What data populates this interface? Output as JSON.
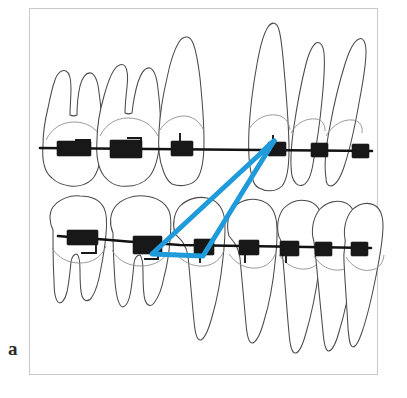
{
  "figure": {
    "panel_label": "a",
    "caption_text": "",
    "frame": {
      "border_color": "#c9c9c9",
      "background": "#ffffff"
    }
  },
  "colors": {
    "elastic_blue": "#1f9bdc",
    "bracket_black": "#181818",
    "archwire_black": "#121212",
    "tooth_outline": "#4a4a4a",
    "crown_line": "#8f8f8f",
    "frame_border": "#c9c9c9",
    "background": "#ffffff"
  },
  "diagram": {
    "type": "orthodontic-appliance-illustration",
    "title": "",
    "arches": [
      {
        "name": "upper-arch",
        "archwire": {
          "x1": 40,
          "y1": 148,
          "x2": 372,
          "y2": 150
        },
        "teeth": [
          {
            "name": "upper-second-molar",
            "type": "molar",
            "roots": 2,
            "cx": 73
          },
          {
            "name": "upper-first-molar",
            "type": "molar",
            "roots": 2,
            "cx": 124
          },
          {
            "name": "upper-second-premolar",
            "type": "premolar",
            "roots": 1,
            "cx": 180
          },
          {
            "name": "upper-canine",
            "type": "canine",
            "roots": 1,
            "cx": 275
          },
          {
            "name": "upper-lateral-incisor",
            "type": "incisor",
            "roots": 1,
            "cx": 311
          },
          {
            "name": "upper-central-incisor",
            "type": "incisor",
            "roots": 1,
            "cx": 345
          }
        ],
        "brackets": [
          {
            "name": "bracket-upper-second-molar",
            "x": 73,
            "y": 148,
            "style": "molar-tube"
          },
          {
            "name": "bracket-upper-first-molar",
            "x": 124,
            "y": 148,
            "style": "molar-tube"
          },
          {
            "name": "bracket-upper-second-premolar",
            "x": 180,
            "y": 147,
            "style": "premolar-bracket"
          },
          {
            "name": "bracket-upper-canine",
            "x": 277,
            "y": 148,
            "style": "anterior-bracket"
          },
          {
            "name": "bracket-upper-lateral-incisor",
            "x": 320,
            "y": 149,
            "style": "anterior-bracket"
          },
          {
            "name": "bracket-upper-central-incisor",
            "x": 361,
            "y": 150,
            "style": "anterior-bracket"
          }
        ]
      },
      {
        "name": "lower-arch",
        "archwire": {
          "x1": 58,
          "y1": 237,
          "x2": 371,
          "y2": 247
        },
        "teeth": [
          {
            "name": "lower-second-molar",
            "type": "molar",
            "roots": 2,
            "cx": 78
          },
          {
            "name": "lower-first-molar",
            "type": "molar",
            "roots": 2,
            "cx": 140
          },
          {
            "name": "lower-second-premolar",
            "type": "premolar",
            "roots": 1,
            "cx": 196
          },
          {
            "name": "lower-first-premolar",
            "type": "premolar",
            "roots": 1,
            "cx": 247
          },
          {
            "name": "lower-canine",
            "type": "canine",
            "roots": 1,
            "cx": 291
          },
          {
            "name": "lower-lateral-incisor",
            "type": "incisor",
            "roots": 1,
            "cx": 326
          },
          {
            "name": "lower-central-incisor",
            "type": "incisor",
            "roots": 1,
            "cx": 358
          }
        ],
        "brackets": [
          {
            "name": "bracket-lower-second-molar",
            "x": 80,
            "y": 237,
            "style": "molar-tube"
          },
          {
            "name": "bracket-lower-first-molar",
            "x": 145,
            "y": 243,
            "style": "molar-tube"
          },
          {
            "name": "bracket-lower-second-premolar",
            "x": 204,
            "y": 246,
            "style": "premolar-bracket"
          },
          {
            "name": "bracket-lower-first-premolar",
            "x": 248,
            "y": 245,
            "style": "premolar-bracket"
          },
          {
            "name": "bracket-lower-canine",
            "x": 288,
            "y": 246,
            "style": "premolar-bracket"
          },
          {
            "name": "bracket-lower-lateral-incisor",
            "x": 323,
            "y": 247,
            "style": "anterior-bracket"
          },
          {
            "name": "bracket-lower-central-incisor",
            "x": 359,
            "y": 248,
            "style": "anterior-bracket"
          }
        ]
      }
    ],
    "elastic": {
      "name": "triangular-elastic",
      "shape": "triangle",
      "color": "#1f9bdc",
      "stroke_width": 5,
      "vertices": [
        {
          "name": "upper-canine-attachment",
          "x": 274,
          "y": 141
        },
        {
          "name": "lower-first-molar-attachment",
          "x": 152,
          "y": 254
        },
        {
          "name": "lower-second-premolar-attachment",
          "x": 203,
          "y": 256
        }
      ]
    }
  }
}
